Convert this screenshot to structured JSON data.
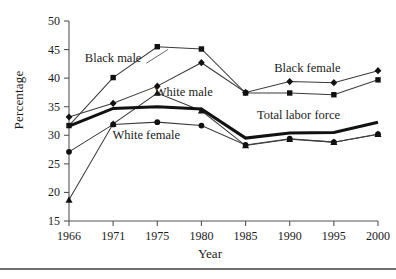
{
  "chart_data": {
    "type": "line",
    "title": "",
    "xlabel": "Year",
    "ylabel": "Percentage",
    "categories": [
      "1966",
      "1971",
      "1975",
      "1980",
      "1985",
      "1990",
      "1995",
      "2000"
    ],
    "x_tick_labels": [
      "1966",
      "1971",
      "1975",
      "1980",
      "1985",
      "1990",
      "1995",
      "2000"
    ],
    "y_tick_labels": [
      "15",
      "20",
      "25",
      "30",
      "35",
      "40",
      "45",
      "50"
    ],
    "y_ticks": [
      15,
      20,
      25,
      30,
      35,
      40,
      45,
      50
    ],
    "ylim": [
      15,
      50
    ],
    "grid": false,
    "legend": "inline annotations",
    "series": [
      {
        "name": "Black male",
        "marker": "square",
        "label": "Black male",
        "values": [
          31.7,
          40.1,
          45.5,
          45.1,
          37.4,
          37.4,
          37.1,
          39.7
        ]
      },
      {
        "name": "Black female",
        "marker": "diamond",
        "label": "Black female",
        "values": [
          33.2,
          35.6,
          38.6,
          42.7,
          37.5,
          39.4,
          39.2,
          41.3
        ]
      },
      {
        "name": "White male",
        "marker": "triangle",
        "label": "White male",
        "values": [
          18.7,
          32.0,
          37.4,
          34.3,
          28.2,
          29.3,
          28.8,
          30.2
        ]
      },
      {
        "name": "White female",
        "marker": "circle",
        "label": "White female",
        "values": [
          27.1,
          31.9,
          32.3,
          31.7,
          28.3,
          29.4,
          28.8,
          30.2
        ]
      },
      {
        "name": "Total labor force",
        "marker": "none",
        "label": "Total labor force",
        "emphasis": "bold",
        "values": [
          31.6,
          34.7,
          35.0,
          34.6,
          29.5,
          30.4,
          30.5,
          32.3
        ]
      }
    ],
    "annotations": [
      {
        "text": "Black male",
        "x": 1971,
        "y": 43.5
      },
      {
        "text": "Black female",
        "x": 1992,
        "y": 41.8
      },
      {
        "text": "White male",
        "x": 1978,
        "y": 37.6
      },
      {
        "text": "Total labor force",
        "x": 1991,
        "y": 33.6
      },
      {
        "text": "White female",
        "x": 1974,
        "y": 30.0
      }
    ],
    "colors": {
      "series": "#333333",
      "emphasis": "#111111",
      "axis": "#555555",
      "background": "#ffffff"
    }
  }
}
